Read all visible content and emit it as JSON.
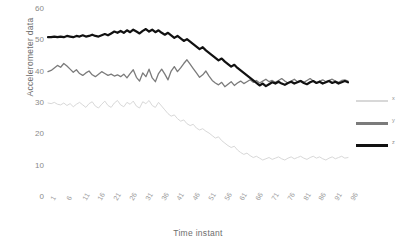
{
  "chart_data": {
    "type": "line",
    "title": "",
    "xlabel": "Time instant",
    "ylabel": "Accelerometer data",
    "ylim": [
      0,
      60
    ],
    "yticks": [
      0,
      10,
      20,
      30,
      40,
      50,
      60
    ],
    "xlim": [
      1,
      96
    ],
    "xticks": [
      1,
      6,
      11,
      16,
      21,
      26,
      31,
      36,
      41,
      46,
      51,
      56,
      61,
      66,
      71,
      76,
      81,
      86,
      91,
      96
    ],
    "grid": false,
    "legend_position": "right",
    "colors": {
      "x": "#d8d8d8",
      "y": "#7b7b7b",
      "z": "#111111"
    },
    "series": [
      {
        "name": "x",
        "color": "#d8d8d8",
        "values": [
          30.0,
          29.8,
          30.2,
          29.6,
          29.4,
          30.0,
          29.2,
          29.8,
          28.8,
          29.6,
          30.2,
          29.4,
          28.6,
          29.8,
          30.4,
          29.0,
          28.4,
          29.6,
          30.6,
          29.2,
          28.6,
          30.0,
          30.8,
          29.4,
          28.8,
          30.2,
          29.6,
          30.6,
          29.0,
          28.4,
          30.4,
          29.8,
          30.8,
          29.2,
          28.6,
          30.2,
          29.0,
          27.8,
          26.6,
          25.8,
          26.2,
          25.0,
          24.2,
          24.6,
          23.4,
          22.8,
          23.2,
          22.0,
          21.4,
          21.8,
          21.0,
          20.4,
          19.6,
          18.8,
          19.2,
          18.0,
          17.2,
          16.4,
          15.8,
          16.2,
          15.0,
          14.2,
          13.6,
          14.0,
          13.2,
          12.6,
          13.0,
          12.4,
          11.8,
          12.2,
          12.6,
          12.0,
          12.4,
          12.8,
          12.2,
          11.8,
          12.4,
          12.8,
          12.2,
          12.6,
          13.0,
          12.4,
          12.0,
          12.6,
          13.0,
          12.4,
          12.8,
          12.2,
          11.8,
          12.4,
          12.8,
          12.2,
          12.6,
          13.0,
          12.4,
          12.6
        ]
      },
      {
        "name": "y",
        "color": "#7b7b7b",
        "values": [
          40.0,
          40.4,
          41.2,
          42.0,
          41.4,
          42.6,
          41.8,
          40.8,
          39.8,
          40.6,
          39.4,
          38.8,
          39.6,
          40.2,
          39.0,
          38.4,
          39.2,
          40.0,
          39.4,
          38.8,
          39.2,
          38.6,
          39.0,
          38.4,
          39.2,
          38.0,
          39.4,
          40.6,
          38.2,
          37.0,
          39.6,
          38.4,
          40.8,
          38.0,
          36.8,
          39.4,
          40.8,
          39.2,
          37.4,
          40.2,
          41.6,
          40.0,
          41.2,
          42.6,
          43.8,
          42.4,
          41.0,
          39.6,
          38.2,
          39.0,
          40.2,
          38.6,
          37.2,
          36.4,
          35.8,
          36.6,
          35.2,
          36.0,
          36.8,
          35.6,
          36.4,
          37.0,
          36.2,
          36.8,
          37.4,
          36.6,
          37.2,
          36.4,
          37.0,
          37.6,
          36.8,
          37.2,
          36.6,
          37.2,
          37.8,
          37.0,
          36.4,
          37.0,
          37.6,
          36.8,
          37.2,
          36.6,
          37.2,
          37.8,
          37.0,
          36.4,
          37.0,
          37.4,
          36.8,
          37.2,
          37.6,
          37.0,
          36.6,
          37.2,
          37.4,
          37.0
        ]
      },
      {
        "name": "z",
        "color": "#111111",
        "values": [
          51.0,
          51.0,
          51.2,
          51.0,
          51.2,
          51.0,
          51.4,
          51.2,
          51.0,
          51.4,
          51.2,
          51.6,
          51.2,
          51.4,
          51.8,
          51.4,
          51.2,
          51.6,
          52.0,
          51.6,
          52.2,
          52.8,
          52.4,
          53.0,
          52.4,
          53.2,
          52.6,
          53.4,
          52.8,
          52.2,
          53.0,
          53.6,
          52.8,
          53.4,
          52.6,
          53.2,
          52.4,
          51.8,
          52.4,
          51.6,
          50.8,
          51.4,
          50.6,
          49.8,
          50.4,
          49.6,
          48.8,
          48.0,
          47.2,
          47.8,
          46.8,
          46.0,
          45.2,
          44.4,
          43.6,
          44.2,
          43.2,
          42.4,
          41.6,
          42.2,
          41.2,
          40.4,
          39.6,
          38.8,
          38.0,
          37.2,
          36.4,
          35.6,
          36.2,
          35.4,
          36.0,
          36.6,
          36.2,
          36.8,
          36.2,
          35.8,
          36.4,
          36.8,
          36.2,
          36.6,
          37.0,
          36.4,
          36.0,
          36.6,
          37.0,
          36.4,
          36.8,
          36.2,
          36.6,
          37.0,
          36.4,
          36.8,
          36.2,
          36.6,
          37.0,
          36.6
        ]
      }
    ]
  },
  "legend": {
    "items": [
      {
        "label": "x",
        "color": "#d8d8d8"
      },
      {
        "label": "y",
        "color": "#7b7b7b"
      },
      {
        "label": "z",
        "color": "#111111"
      }
    ]
  }
}
